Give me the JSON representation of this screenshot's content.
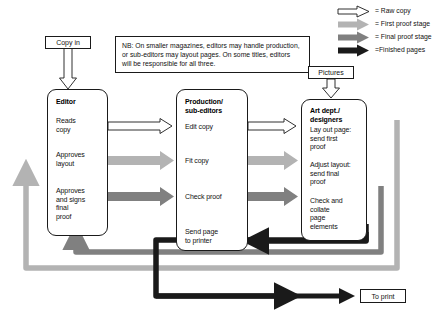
{
  "diagram": {
    "colors": {
      "raw_copy": "#ffffff",
      "raw_copy_stroke": "#1a1a1a",
      "first_proof": "#b3b3b3",
      "final_proof": "#808080",
      "finished_pages": "#1a1a1a",
      "text": "#111111",
      "background": "#ffffff"
    }
  },
  "legend": {
    "items": [
      {
        "id": "raw-copy",
        "label": "= Raw copy",
        "style": "outline",
        "color": "#ffffff"
      },
      {
        "id": "first-proof-stage",
        "label": "= First proof stage",
        "style": "solid",
        "color": "#b3b3b3"
      },
      {
        "id": "final-proof-stage",
        "label": "= Final proof stage",
        "style": "solid",
        "color": "#808080"
      },
      {
        "id": "finished-pages",
        "label": "=Finished pages",
        "style": "solid",
        "color": "#1a1a1a"
      }
    ]
  },
  "note": {
    "lines": [
      "NB: On smaller magazines, editors may handle production,",
      "or sub-editors may layout pages. On some titles, editors",
      "will be responsible for all three."
    ]
  },
  "inputs": {
    "copy_in": "Copy in",
    "pictures": "Pictures"
  },
  "outputs": {
    "to_print": "To print"
  },
  "columns": [
    {
      "id": "editor",
      "title": "Editor",
      "steps": [
        "Reads\ncopy",
        "Approves\nlayout",
        "Approves\nand signs\nfinal\nproof"
      ]
    },
    {
      "id": "production-sub-editors",
      "title": "Production/\nsub-editors",
      "steps": [
        "Edit copy",
        "Fit copy",
        "Check proof",
        "Send page\nto printer"
      ]
    },
    {
      "id": "art-dept-designers",
      "title": "Art dept./\ndesigners",
      "steps": [
        "Lay out page:\nsend first\nproof",
        "Adjust layout:\nsend final\nproof",
        "Check and\ncollate\npage\nelements"
      ]
    }
  ]
}
